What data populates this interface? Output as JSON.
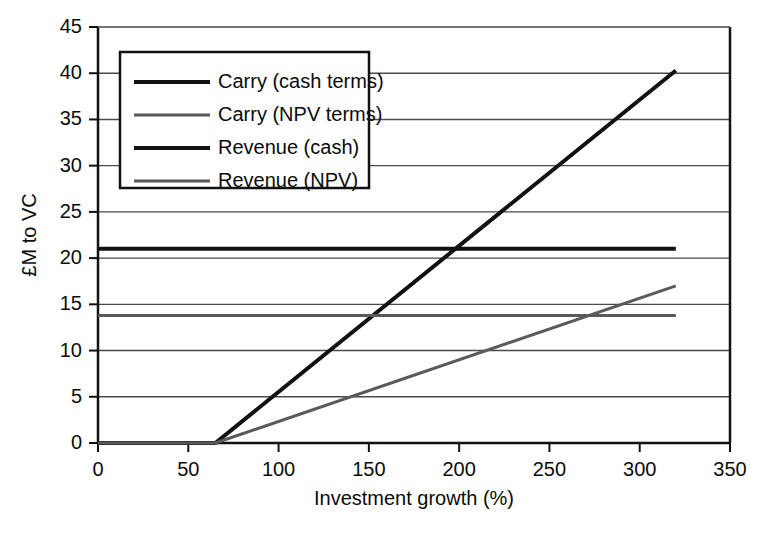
{
  "chart_data": {
    "type": "line",
    "title": "",
    "xlabel": "Investment growth (%)",
    "ylabel": "£M to VC",
    "xlim": [
      0,
      350
    ],
    "ylim": [
      0,
      45
    ],
    "xticks": [
      0,
      50,
      100,
      150,
      200,
      250,
      300,
      350
    ],
    "yticks": [
      0,
      5,
      10,
      15,
      20,
      25,
      30,
      35,
      40,
      45
    ],
    "grid": "horizontal",
    "legend_position": "upper-left-inside",
    "series": [
      {
        "name": "Carry (cash terms)",
        "color": "#111111",
        "width": 4,
        "x": [
          0,
          65,
          320
        ],
        "y": [
          0,
          0,
          40.3
        ]
      },
      {
        "name": "Carry (NPV terms)",
        "color": "#5a5a5a",
        "width": 3,
        "x": [
          0,
          65,
          320
        ],
        "y": [
          0,
          0,
          17.0
        ]
      },
      {
        "name": "Revenue (cash)",
        "color": "#111111",
        "width": 4,
        "x": [
          0,
          320
        ],
        "y": [
          21.0,
          21.0
        ]
      },
      {
        "name": "Revenue (NPV)",
        "color": "#5a5a5a",
        "width": 3,
        "x": [
          0,
          320
        ],
        "y": [
          13.8,
          13.8
        ]
      }
    ],
    "annotations": [
      "Carry (cash) crosses Revenue (cash) near 203% growth",
      "Carry (NPV) crosses Revenue (NPV) near 281% growth"
    ]
  },
  "axes": {
    "x_tick_labels": [
      "0",
      "50",
      "100",
      "150",
      "200",
      "250",
      "300",
      "350"
    ],
    "y_tick_labels": [
      "0",
      "5",
      "10",
      "15",
      "20",
      "25",
      "30",
      "35",
      "40",
      "45"
    ],
    "x_title": "Investment growth (%)",
    "y_title": "£M to VC"
  },
  "legend": {
    "entries": [
      {
        "label": "Carry (cash terms)",
        "color": "#111111",
        "width": 4
      },
      {
        "label": "Carry (NPV terms)",
        "color": "#5a5a5a",
        "width": 3
      },
      {
        "label": "Revenue (cash)",
        "color": "#111111",
        "width": 4
      },
      {
        "label": "Revenue (NPV)",
        "color": "#5a5a5a",
        "width": 3
      }
    ]
  },
  "style": {
    "axis_color": "#111111",
    "grid_color": "#4a4a4a",
    "background": "#ffffff",
    "text_color": "#0b0b0b"
  }
}
